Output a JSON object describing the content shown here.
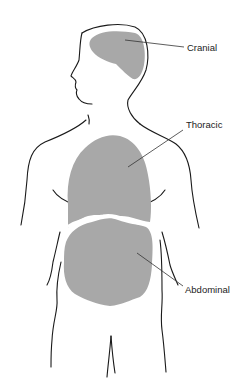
{
  "diagram": {
    "colors": {
      "outline": "#1a1a1a",
      "cavity_fill": "#a8a8a8",
      "background": "#ffffff"
    },
    "labels": [
      {
        "id": "cranial",
        "text": "Cranial"
      },
      {
        "id": "thoracic",
        "text": "Thoracic"
      },
      {
        "id": "abdominal",
        "text": "Abdominal"
      }
    ]
  }
}
